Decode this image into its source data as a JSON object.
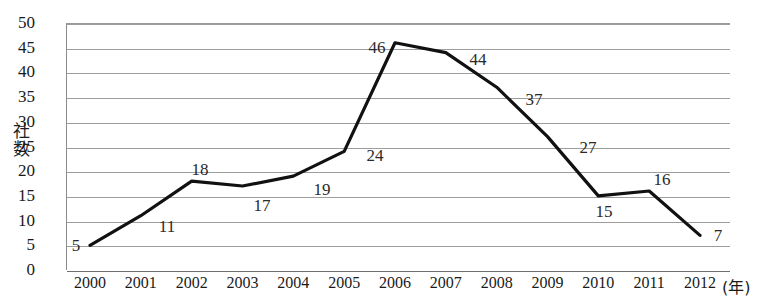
{
  "chart_data": {
    "type": "line",
    "title": "",
    "xlabel": "(年)",
    "ylabel": "社数",
    "categories": [
      "2000",
      "2001",
      "2002",
      "2003",
      "2004",
      "2005",
      "2006",
      "2007",
      "2008",
      "2009",
      "2010",
      "2011",
      "2012"
    ],
    "values": [
      5,
      11,
      18,
      17,
      19,
      24,
      46,
      44,
      37,
      27,
      15,
      16,
      7
    ],
    "ylim": [
      0,
      50
    ],
    "ytick_labels": [
      "0",
      "5",
      "10",
      "15",
      "20",
      "25",
      "30",
      "35",
      "40",
      "45",
      "50"
    ],
    "ytick_values": [
      0,
      5,
      10,
      15,
      20,
      25,
      30,
      35,
      40,
      45,
      50
    ],
    "grid": true,
    "legend": "none",
    "line_color": "#111111",
    "grid_color": "#9d9d9d",
    "background_color": "#ffffff",
    "data_labels": [
      {
        "value": "5",
        "x": 76,
        "y": 246
      },
      {
        "value": "11",
        "x": 167,
        "y": 227
      },
      {
        "value": "18",
        "x": 200,
        "y": 170
      },
      {
        "value": "17",
        "x": 262,
        "y": 206
      },
      {
        "value": "19",
        "x": 322,
        "y": 190
      },
      {
        "value": "24",
        "x": 375,
        "y": 156
      },
      {
        "value": "46",
        "x": 377,
        "y": 48
      },
      {
        "value": "47",
        "x": 0,
        "y": 0
      },
      {
        "value": "44",
        "x": 478,
        "y": 60
      },
      {
        "value": "37",
        "x": 534,
        "y": 100
      },
      {
        "value": "27",
        "x": 588,
        "y": 148
      },
      {
        "value": "15",
        "x": 604,
        "y": 212
      },
      {
        "value": "16",
        "x": 662,
        "y": 180
      },
      {
        "value": "7",
        "x": 718,
        "y": 236
      }
    ],
    "axis_title_chars": [
      "社",
      "数"
    ]
  },
  "chart": {
    "y_axis_title_top": "社",
    "y_axis_title_bottom": "数",
    "x_axis_unit": "(年)"
  }
}
